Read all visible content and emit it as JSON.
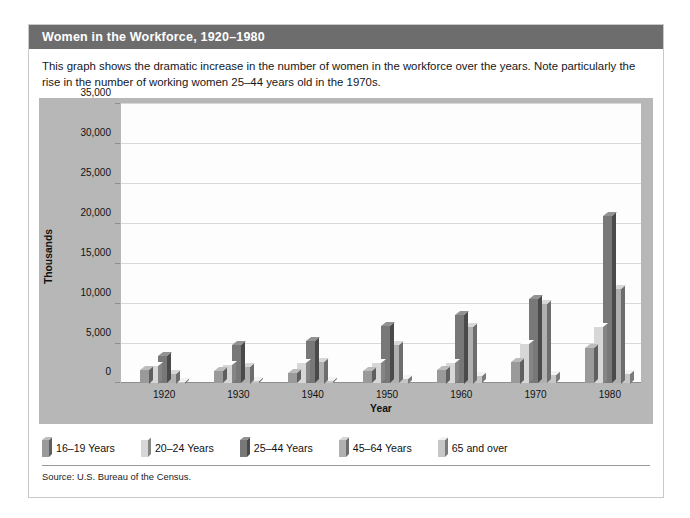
{
  "title": "Women in the Workforce, 1920–1980",
  "caption": "This graph shows the dramatic increase in the number of women in the workforce over the years. Note particularly the rise in the number of working women 25–44 years old in the 1970s.",
  "source": "Source: U.S. Bureau of the Census.",
  "colors": {
    "titlebar": "#6d6d6d",
    "panel": "#b7b7b7",
    "plot": "#fdfdfd",
    "grid": "#d8d8d8",
    "series": [
      "#9a9a9a",
      "#d7d7d7",
      "#787878",
      "#b0b0b0",
      "#c6c6c6"
    ]
  },
  "chart_data": {
    "type": "bar",
    "title": "Women in the Workforce, 1920–1980",
    "xlabel": "Year",
    "ylabel": "Thousands",
    "categories": [
      "1920",
      "1930",
      "1940",
      "1950",
      "1960",
      "1970",
      "1980"
    ],
    "ylim": [
      0,
      35000
    ],
    "yticks": [
      0,
      5000,
      10000,
      15000,
      20000,
      25000,
      30000,
      35000
    ],
    "ytick_labels": [
      "0",
      "5,000",
      "10,000",
      "15,000",
      "20,000",
      "25,000",
      "30,000",
      "35,000"
    ],
    "grid": true,
    "legend_position": "below",
    "series": [
      {
        "name": "16–19 Years",
        "values": [
          1700,
          1500,
          1300,
          1500,
          1700,
          2700,
          4400
        ]
      },
      {
        "name": "20–24 Years",
        "values": [
          2200,
          2300,
          2500,
          2500,
          2600,
          4900,
          7100
        ]
      },
      {
        "name": "25–44 Years",
        "values": [
          3400,
          4800,
          5300,
          7200,
          8600,
          10600,
          21000
        ]
      },
      {
        "name": "45–64 Years",
        "values": [
          1200,
          2100,
          2700,
          4800,
          7100,
          9900,
          11900
        ]
      },
      {
        "name": "65 and over",
        "values": [
          200,
          300,
          300,
          600,
          900,
          1000,
          1200
        ]
      }
    ]
  }
}
